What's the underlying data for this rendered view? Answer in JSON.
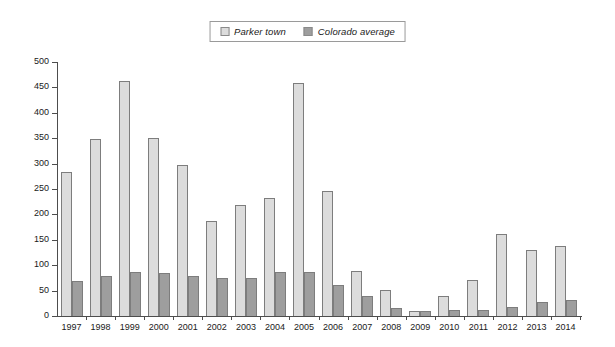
{
  "chart_data": {
    "type": "bar",
    "title": "",
    "xlabel": "",
    "ylabel": "",
    "ylim": [
      0,
      500
    ],
    "ytick_step": 50,
    "yticks": [
      0,
      50,
      100,
      150,
      200,
      250,
      300,
      350,
      400,
      450,
      500
    ],
    "grid": false,
    "legend_position": "top-center",
    "categories": [
      "1997",
      "1998",
      "1999",
      "2000",
      "2001",
      "2002",
      "2003",
      "2004",
      "2005",
      "2006",
      "2007",
      "2008",
      "2009",
      "2010",
      "2011",
      "2012",
      "2013",
      "2014"
    ],
    "series": [
      {
        "name": "Parker town",
        "color": "#dcdcdc",
        "values": [
          283,
          348,
          462,
          350,
          297,
          188,
          218,
          232,
          458,
          246,
          89,
          51,
          10,
          40,
          71,
          162,
          130,
          138
        ]
      },
      {
        "name": "Colorado average",
        "color": "#9e9e9e",
        "values": [
          68,
          79,
          86,
          85,
          78,
          74,
          74,
          87,
          86,
          61,
          40,
          16,
          9,
          12,
          12,
          18,
          28,
          32
        ]
      }
    ]
  },
  "legend": {
    "entries": [
      {
        "label": "Parker town",
        "swatch_color": "#dcdcdc",
        "icon": "legend-swatch-icon"
      },
      {
        "label": "Colorado average",
        "swatch_color": "#9e9e9e",
        "icon": "legend-swatch-icon"
      }
    ]
  }
}
